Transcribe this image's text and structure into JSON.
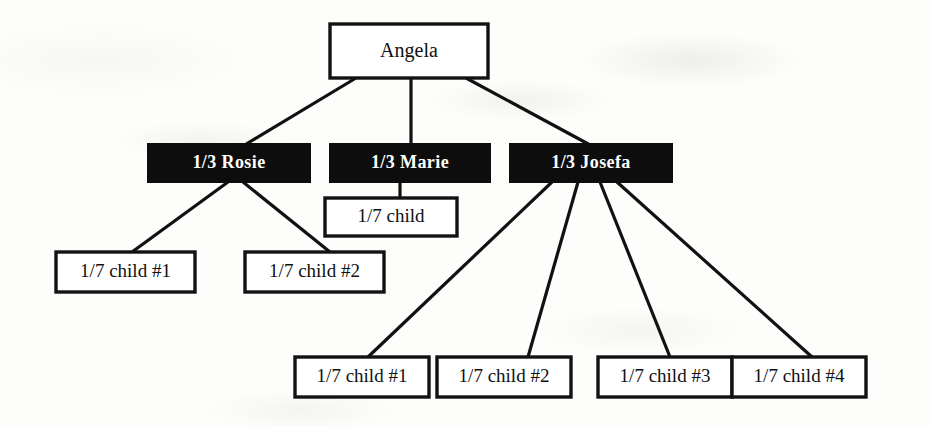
{
  "diagram": {
    "type": "tree",
    "colors": {
      "line": "#111111",
      "box_border": "#121212",
      "box_fill_plain": "#ffffff",
      "box_fill_filled": "#0d0d0d",
      "text_plain": "#101010",
      "text_inverse": "#ffffff",
      "background": "#fdfdfb"
    },
    "nodes": [
      {
        "id": "angela",
        "label": "Angela",
        "style": "plain",
        "level": 0,
        "x": 330,
        "y": 24,
        "w": 158,
        "h": 54
      },
      {
        "id": "rosie",
        "label": "1/3 Rosie",
        "style": "filled",
        "level": 1,
        "x": 148,
        "y": 144,
        "w": 162,
        "h": 38
      },
      {
        "id": "marie",
        "label": "1/3 Marie",
        "style": "filled",
        "level": 1,
        "x": 330,
        "y": 144,
        "w": 160,
        "h": 38
      },
      {
        "id": "josefa",
        "label": "1/3 Josefa",
        "style": "filled",
        "level": 1,
        "x": 510,
        "y": 144,
        "w": 162,
        "h": 38
      },
      {
        "id": "rosie-c1",
        "label": "1/7 child #1",
        "style": "plain",
        "level": 2,
        "x": 56,
        "y": 252,
        "w": 139,
        "h": 40
      },
      {
        "id": "rosie-c2",
        "label": "1/7 child #2",
        "style": "plain",
        "level": 2,
        "x": 245,
        "y": 252,
        "w": 139,
        "h": 40
      },
      {
        "id": "marie-c1",
        "label": "1/7 child",
        "style": "plain",
        "level": 2,
        "x": 325,
        "y": 198,
        "w": 132,
        "h": 38
      },
      {
        "id": "josefa-c1",
        "label": "1/7 child #1",
        "style": "plain",
        "level": 3,
        "x": 295,
        "y": 357,
        "w": 134,
        "h": 40
      },
      {
        "id": "josefa-c2",
        "label": "1/7 child #2",
        "style": "plain",
        "level": 3,
        "x": 437,
        "y": 357,
        "w": 134,
        "h": 40
      },
      {
        "id": "josefa-c3",
        "label": "1/7 child #3",
        "style": "plain",
        "level": 3,
        "x": 598,
        "y": 357,
        "w": 134,
        "h": 40
      },
      {
        "id": "josefa-c4",
        "label": "1/7 child #4",
        "style": "plain",
        "level": 3,
        "x": 732,
        "y": 357,
        "w": 134,
        "h": 40
      }
    ],
    "edges": [
      {
        "id": "angela-rosie",
        "from": "angela",
        "to": "rosie",
        "x1": 356,
        "y1": 78,
        "x2": 243,
        "y2": 146
      },
      {
        "id": "angela-marie",
        "from": "angela",
        "to": "marie",
        "x1": 411,
        "y1": 78,
        "x2": 411,
        "y2": 146
      },
      {
        "id": "angela-josefa",
        "from": "angela",
        "to": "josefa",
        "x1": 466,
        "y1": 78,
        "x2": 592,
        "y2": 146
      },
      {
        "id": "rosie-child1",
        "from": "rosie",
        "to": "rosie-c1",
        "x1": 228,
        "y1": 182,
        "x2": 132,
        "y2": 252
      },
      {
        "id": "rosie-child2",
        "from": "rosie",
        "to": "rosie-c2",
        "x1": 243,
        "y1": 182,
        "x2": 330,
        "y2": 252
      },
      {
        "id": "marie-child1",
        "from": "marie",
        "to": "marie-c1",
        "x1": 400,
        "y1": 182,
        "x2": 400,
        "y2": 198
      },
      {
        "id": "josefa-child1",
        "from": "josefa",
        "to": "josefa-c1",
        "x1": 552,
        "y1": 182,
        "x2": 368,
        "y2": 357
      },
      {
        "id": "josefa-child2",
        "from": "josefa",
        "to": "josefa-c2",
        "x1": 578,
        "y1": 182,
        "x2": 528,
        "y2": 357
      },
      {
        "id": "josefa-child3",
        "from": "josefa",
        "to": "josefa-c3",
        "x1": 600,
        "y1": 182,
        "x2": 670,
        "y2": 357
      },
      {
        "id": "josefa-child4",
        "from": "josefa",
        "to": "josefa-c4",
        "x1": 617,
        "y1": 182,
        "x2": 812,
        "y2": 357
      }
    ]
  }
}
